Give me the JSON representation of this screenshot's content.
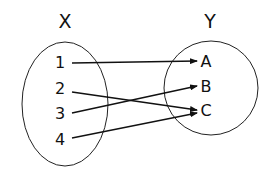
{
  "diagram": {
    "type": "mapping",
    "domain": {
      "label": "X",
      "elements": [
        "1",
        "2",
        "3",
        "4"
      ]
    },
    "codomain": {
      "label": "Y",
      "elements": [
        "A",
        "B",
        "C"
      ]
    },
    "mappings": [
      {
        "from": "1",
        "to": "A"
      },
      {
        "from": "2",
        "to": "C"
      },
      {
        "from": "3",
        "to": "B"
      },
      {
        "from": "4",
        "to": "C"
      }
    ]
  }
}
